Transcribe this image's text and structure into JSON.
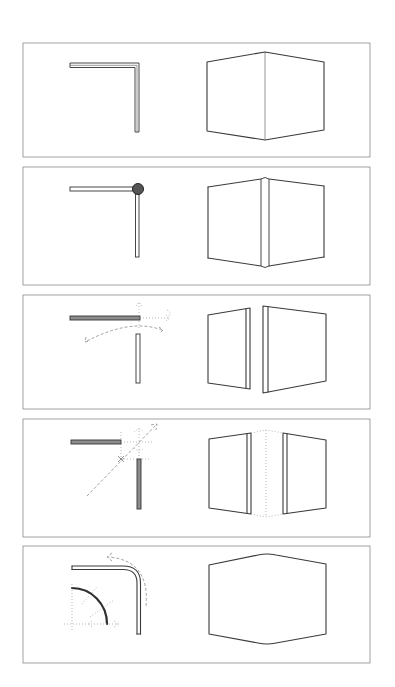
{
  "figure": {
    "panel_count": 5,
    "panels": [
      {
        "id": 1,
        "plan": "simple mitered L corner, two thin walls meeting",
        "elevation": "two planes meeting at a single vertical edge"
      },
      {
        "id": 2,
        "plan": "L corner with a round post/node at the joint",
        "elevation": "two planes joined by a narrow vertical corner post"
      },
      {
        "id": 3,
        "plan": "walls separated, horizontal wall pulled back with movement arrows",
        "elevation": "two planes separated by a gap, each showing thickened end"
      },
      {
        "id": 4,
        "plan": "walls separated diagonally with crosshair and diagonal axis arrow",
        "elevation": "two planes separated with dotted virtual corner line"
      },
      {
        "id": 5,
        "plan": "rounded L corner with radius construction and curved direction arrow",
        "elevation": "single continuous curved surface wrapping the corner"
      }
    ]
  },
  "colors": {
    "ink": "#333333",
    "frame": "#8a8a8a",
    "background": "#ffffff",
    "node_fill": "#555555"
  }
}
